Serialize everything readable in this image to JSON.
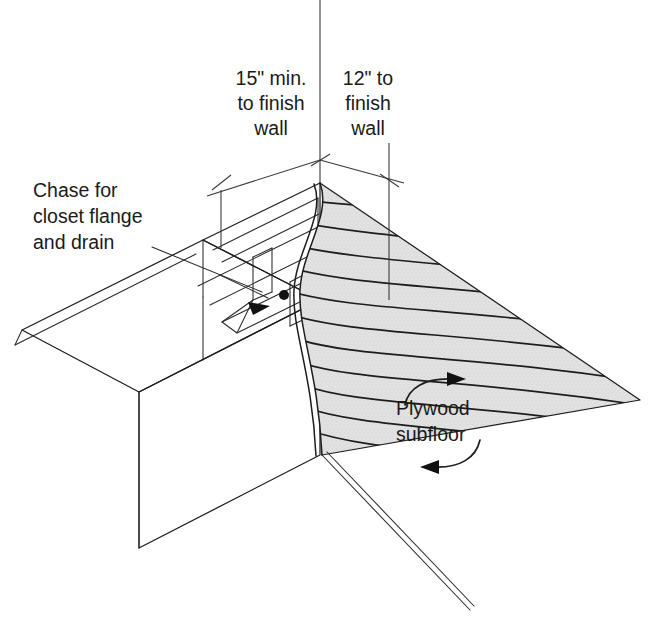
{
  "title": "Chase framing for closet flange and drain — isometric detail",
  "annotations": {
    "dim_left": {
      "line1": "15\" min.",
      "line2": "to finish",
      "line3": "wall",
      "value": "15\"",
      "qualifier": "min.",
      "reference": "finish wall"
    },
    "dim_right": {
      "line1": "12\" to",
      "line2": "finish",
      "line3": "wall",
      "value": "12\"",
      "qualifier": "",
      "reference": "finish wall"
    },
    "chase_label": {
      "line1": "Chase for",
      "line2": "closet flange",
      "line3": "and drain"
    },
    "plywood_label": {
      "line1": "Plywood",
      "line2": "subfloor"
    }
  },
  "icons": {
    "chase_leader": "leader-line-icon",
    "arrowhead_chase": "arrowhead-icon",
    "drain_point": "drain-point-icon",
    "grain_arrow_upper": "curved-arrow-icon",
    "grain_arrow_lower": "curved-arrow-icon",
    "dim_tick_left": "dimension-tick-icon",
    "dim_tick_center": "dimension-tick-icon",
    "dim_tick_right": "dimension-tick-icon",
    "break_line": "break-line-icon"
  },
  "colors": {
    "line": "#1d1d1d",
    "thin_line": "#2a2a2a",
    "dimension_line": "#3a3a3a",
    "plywood_fill": "#e2e2e2",
    "stipple_dot": "#a8a8a8",
    "background": "#ffffff",
    "text": "#1a1a1a",
    "solid_marker": "#111111"
  },
  "geometry_notes": {
    "projection": "isometric",
    "view": "cut-away of plywood subfloor over floor framing",
    "cut_edge": "wavy break line"
  }
}
